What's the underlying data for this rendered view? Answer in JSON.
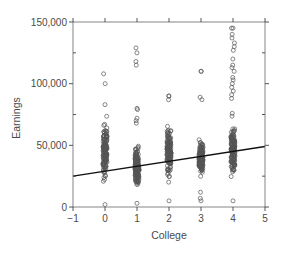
{
  "chart_data": {
    "type": "scatter",
    "title": "",
    "xlabel": "College",
    "ylabel": "Earnings",
    "xlim": [
      -1,
      5
    ],
    "ylim": [
      0,
      150000
    ],
    "x_ticks": [
      -1,
      0,
      1,
      2,
      3,
      4,
      5
    ],
    "x_tick_labels": [
      "−1",
      "0",
      "1",
      "2",
      "3",
      "4",
      "5"
    ],
    "y_ticks": [
      0,
      50000,
      100000,
      150000
    ],
    "y_tick_labels": [
      "0",
      "50,000",
      "100,000",
      "150,000"
    ],
    "y_minor_ticks": [
      25000,
      75000,
      125000
    ],
    "grid": false,
    "legend": null,
    "marker": "open-circle",
    "series": [
      {
        "name": "observations",
        "groups": [
          {
            "x": 0,
            "min": 2000,
            "max": 83000,
            "outliers": [
              108000,
              100000
            ],
            "dense_range": [
              5000,
              80000
            ]
          },
          {
            "x": 1,
            "min": 3000,
            "max": 80000,
            "outliers": [
              129000,
              125000,
              118000,
              115000,
              79000,
              72000,
              70000,
              68000
            ],
            "dense_range": [
              5000,
              58000
            ]
          },
          {
            "x": 2,
            "min": 5000,
            "max": 90000,
            "outliers": [
              90000,
              87000
            ],
            "dense_range": [
              5000,
              80000
            ]
          },
          {
            "x": 3,
            "min": 5000,
            "max": 110000,
            "outliers": [
              110000,
              89000,
              87000,
              12000,
              7000
            ],
            "dense_range": [
              15000,
              62000
            ]
          },
          {
            "x": 4,
            "min": 5000,
            "max": 145000,
            "outliers": [
              145000,
              140000,
              137000,
              133000,
              130000,
              127000,
              120000,
              115000,
              113000,
              110000,
              105000,
              103000,
              100000,
              97000,
              94000,
              91000,
              88000
            ],
            "dense_range": [
              10000,
              80000
            ]
          }
        ]
      }
    ],
    "regression_line": {
      "x": [
        -1,
        5
      ],
      "y": [
        25000,
        49000
      ],
      "slope": 4000,
      "intercept": 29000
    }
  }
}
